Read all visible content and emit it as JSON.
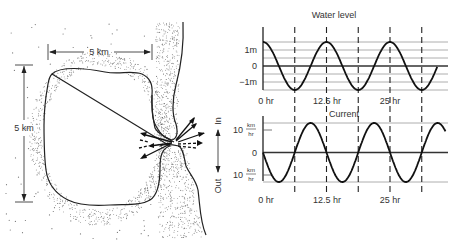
{
  "map": {
    "width_label": "5 km",
    "height_label": "5 km",
    "in_label": "In",
    "out_label": "Out"
  },
  "chart_data": [
    {
      "type": "line",
      "title": "Water level",
      "xlabel": "",
      "ylabel": "",
      "x_tick_labels": [
        "0 hr",
        "12.5 hr",
        "25 hr"
      ],
      "x_ticks_hr": [
        0,
        12.5,
        25
      ],
      "y_tick_labels": [
        "1m",
        "0",
        "−1m"
      ],
      "y_ticks": [
        1,
        0,
        -1
      ],
      "ylim": [
        -1.5,
        1.5
      ],
      "xlim": [
        0,
        34.4
      ],
      "dashed_vertical_lines_hr": [
        6.25,
        12.5,
        18.75,
        25,
        31.25
      ],
      "series": [
        {
          "name": "Water level",
          "function": "cosine",
          "amplitude_m": 1.5,
          "period_hr": 12.5,
          "phase": "max at 0 hr",
          "x_range_hr": [
            0,
            34.4
          ]
        }
      ],
      "grid": true
    },
    {
      "type": "line",
      "title": "Current",
      "xlabel": "",
      "ylabel": "",
      "x_tick_labels": [
        "0 hr",
        "12.5 hr",
        "25 hr"
      ],
      "x_ticks_hr": [
        0,
        12.5,
        25
      ],
      "y_tick_labels": [
        {
          "value": "10",
          "num": "km",
          "den": "hr"
        },
        {
          "value": "0"
        },
        {
          "value": "10",
          "num": "km",
          "den": "hr"
        }
      ],
      "y_ticks": [
        10,
        0,
        -10
      ],
      "ylim": [
        -13,
        13
      ],
      "xlim": [
        0,
        36
      ],
      "dashed_vertical_lines_hr": [
        6.25,
        12.5,
        18.75,
        25,
        31.25
      ],
      "series": [
        {
          "name": "Current",
          "function": "negative sine",
          "amplitude_kmh": 13,
          "period_hr": 12.5,
          "phase": "zero at 0 hr, decreasing",
          "x_range_hr": [
            0,
            36
          ]
        }
      ],
      "grid": true
    }
  ]
}
